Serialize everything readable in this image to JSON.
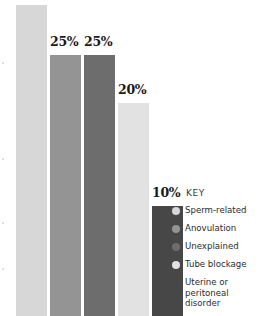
{
  "chart_data": {
    "type": "bar",
    "title": "",
    "subtitle": "",
    "xlabel": "",
    "ylabel": "",
    "grid": false,
    "legend_position": "right",
    "ylim": [
      0,
      30
    ],
    "categories": [
      "Sperm-related",
      "Anovulation",
      "Unexplained",
      "Tube blockage",
      "Uterine or peritoneal disorder"
    ],
    "values": [
      30,
      25,
      25,
      20,
      10
    ],
    "data_labels": [
      "",
      "25%",
      "25%",
      "20%",
      "10%"
    ],
    "colors": [
      "#d7d7d7",
      "#949494",
      "#6d6d6d",
      "#e2e2e2",
      "#474747"
    ],
    "bars": [
      {
        "name": "Sperm-related",
        "value": 30,
        "label": "",
        "color": "#d7d7d7",
        "left": 16,
        "width": 31,
        "top": 5
      },
      {
        "name": "Anovulation",
        "value": 25,
        "label": "25%",
        "color": "#949494",
        "left": 50,
        "width": 31,
        "top": 55
      },
      {
        "name": "Unexplained",
        "value": 25,
        "label": "25%",
        "color": "#6d6d6d",
        "left": 84,
        "width": 31,
        "top": 55
      },
      {
        "name": "Tube blockage",
        "value": 20,
        "label": "20%",
        "color": "#e2e2e2",
        "left": 118,
        "width": 31,
        "top": 103
      },
      {
        "name": "Uterine or peritoneal disorder",
        "value": 10,
        "label": "10%",
        "color": "#474747",
        "left": 152,
        "width": 31,
        "top": 206
      }
    ],
    "label_positions": [
      {
        "label": "25%",
        "left": 50,
        "top": 36
      },
      {
        "label": "25%",
        "left": 84,
        "top": 36
      },
      {
        "label": "20%",
        "left": 118,
        "top": 84
      },
      {
        "label": "10%",
        "left": 152,
        "top": 187
      }
    ]
  },
  "legend": {
    "title": "KEY",
    "items": [
      {
        "label": "Sperm-related",
        "color": "#d7d7d7"
      },
      {
        "label": "Anovulation",
        "color": "#949494"
      },
      {
        "label": "Unexplained",
        "color": "#6d6d6d"
      },
      {
        "label": "Tube blockage",
        "color": "#e2e2e2"
      },
      {
        "label": "Uterine or\nperitoneal disorder",
        "color": "#474747"
      }
    ]
  }
}
